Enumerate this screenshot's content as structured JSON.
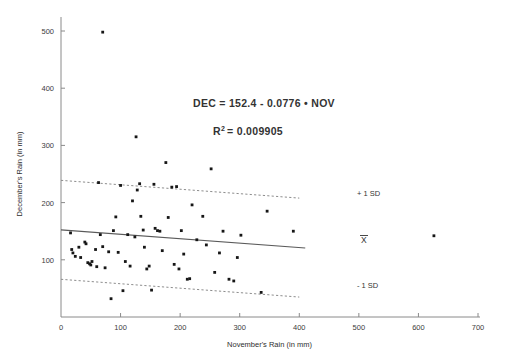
{
  "chart_data": {
    "type": "scatter",
    "title": "",
    "xlabel": "November's Rain (in mm)",
    "ylabel": "December's Rain (in mm)",
    "xlim": [
      0,
      700
    ],
    "ylim": [
      0,
      530
    ],
    "xticks": [
      0,
      100,
      200,
      300,
      400,
      500,
      600,
      700
    ],
    "yticks": [
      0,
      100,
      200,
      300,
      400,
      500
    ],
    "grid": false,
    "legend": "none",
    "annotations": {
      "equation": "DEC = 152.4 - 0.0776 • NOV",
      "r_squared_label": "R",
      "r_squared_sup": "2",
      "r_squared_value": "= 0.009905",
      "plus_one_sd": "+ 1 SD",
      "mean_label": "X",
      "minus_one_sd": "- 1 SD"
    },
    "fit_line": {
      "intercept": 152.4,
      "slope": -0.0776,
      "x_start": 0,
      "x_end": 410
    },
    "sd_bands": {
      "sd_value": 86.5,
      "upper_x_start": 0,
      "upper_x_end": 400,
      "lower_x_start": 0,
      "lower_x_end": 400
    },
    "points": [
      [
        70,
        498
      ],
      [
        16,
        147
      ],
      [
        18,
        118
      ],
      [
        20,
        112
      ],
      [
        24,
        106
      ],
      [
        30,
        122
      ],
      [
        33,
        104
      ],
      [
        40,
        131
      ],
      [
        42,
        128
      ],
      [
        45,
        95
      ],
      [
        48,
        93
      ],
      [
        50,
        91
      ],
      [
        52,
        97
      ],
      [
        58,
        118
      ],
      [
        60,
        88
      ],
      [
        63,
        235
      ],
      [
        66,
        144
      ],
      [
        70,
        123
      ],
      [
        74,
        86
      ],
      [
        80,
        114
      ],
      [
        84,
        32
      ],
      [
        88,
        151
      ],
      [
        92,
        175
      ],
      [
        96,
        113
      ],
      [
        100,
        230
      ],
      [
        104,
        46
      ],
      [
        108,
        97
      ],
      [
        112,
        144
      ],
      [
        116,
        89
      ],
      [
        120,
        203
      ],
      [
        124,
        140
      ],
      [
        126,
        315
      ],
      [
        128,
        222
      ],
      [
        132,
        233
      ],
      [
        134,
        176
      ],
      [
        138,
        152
      ],
      [
        140,
        122
      ],
      [
        144,
        84
      ],
      [
        148,
        89
      ],
      [
        152,
        47
      ],
      [
        156,
        232
      ],
      [
        158,
        155
      ],
      [
        162,
        151
      ],
      [
        166,
        150
      ],
      [
        170,
        116
      ],
      [
        176,
        270
      ],
      [
        180,
        174
      ],
      [
        186,
        227
      ],
      [
        190,
        92
      ],
      [
        194,
        228
      ],
      [
        198,
        84
      ],
      [
        202,
        151
      ],
      [
        206,
        110
      ],
      [
        212,
        66
      ],
      [
        216,
        67
      ],
      [
        220,
        196
      ],
      [
        228,
        135
      ],
      [
        238,
        176
      ],
      [
        244,
        126
      ],
      [
        252,
        259
      ],
      [
        258,
        78
      ],
      [
        266,
        112
      ],
      [
        272,
        150
      ],
      [
        282,
        66
      ],
      [
        290,
        63
      ],
      [
        296,
        104
      ],
      [
        302,
        143
      ],
      [
        336,
        43
      ],
      [
        346,
        185
      ],
      [
        390,
        150
      ],
      [
        626,
        142
      ]
    ]
  }
}
